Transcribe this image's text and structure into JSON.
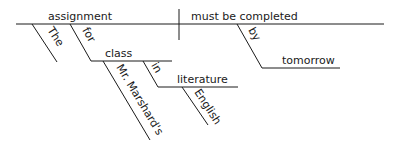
{
  "diagram": {
    "type": "sentence-diagram",
    "sentence": "The assignment for Mr. Marshard's class in English literature must be completed by tomorrow",
    "subject": "assignment",
    "predicate": "must be completed",
    "modifiers": {
      "article": "The",
      "prep1": "for",
      "prep1_object": "class",
      "prep1_object_modifier": "Mr. Marshard's",
      "prep2": "in",
      "prep2_object": "literature",
      "prep2_object_modifier": "English",
      "prep3": "by",
      "prep3_object": "tomorrow"
    }
  }
}
